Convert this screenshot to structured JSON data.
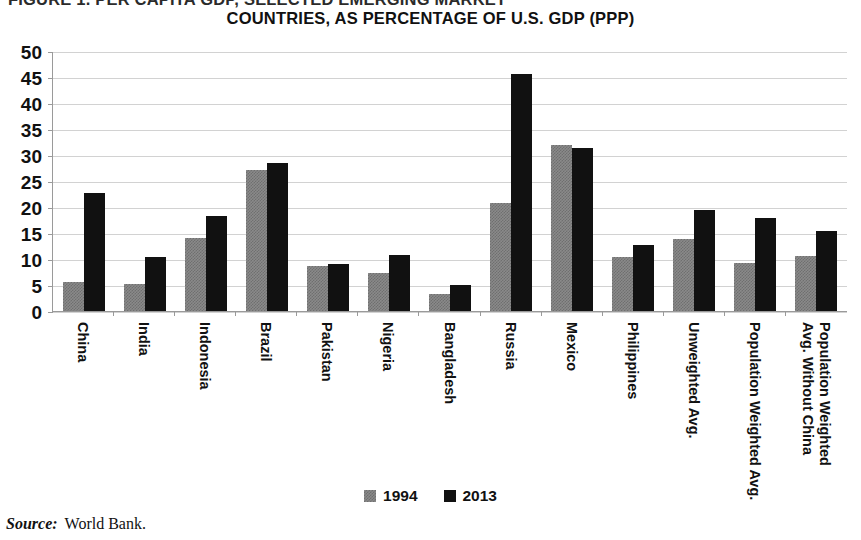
{
  "title": {
    "line1": "FIGURE 1. PER CAPITA GDP, SELECTED EMERGING MARKET",
    "line2": "COUNTRIES, AS PERCENTAGE OF U.S. GDP (PPP)"
  },
  "legend": {
    "position": "bottom-center",
    "entries": [
      {
        "label": "1994",
        "color": "#8a8a8a"
      },
      {
        "label": "2013",
        "color": "#111111"
      }
    ]
  },
  "source": {
    "key": "Source:",
    "value": "World Bank."
  },
  "axis": {
    "y_ticks": [
      "50",
      "45",
      "40",
      "35",
      "30",
      "25",
      "20",
      "15",
      "10",
      "5",
      "0"
    ]
  },
  "chart_data": {
    "type": "bar",
    "title": "FIGURE 1. PER CAPITA GDP, SELECTED EMERGING MARKET COUNTRIES, AS PERCENTAGE OF U.S. GDP (PPP)",
    "xlabel": "",
    "ylabel": "",
    "ylim": [
      0,
      50
    ],
    "ytick_step": 5,
    "grid": true,
    "legend_position": "bottom-center",
    "categories": [
      "China",
      "India",
      "Indonesia",
      "Brazil",
      "Pakistan",
      "Nigeria",
      "Bangladesh",
      "Russia",
      "Mexico",
      "Philippines",
      "Unweighted Avg.",
      "Population Weighted Avg.",
      "Population Weighted Avg. Without China"
    ],
    "series": [
      {
        "name": "1994",
        "color": "#8a8a8a",
        "values": [
          5.6,
          5.2,
          14.0,
          27.2,
          8.6,
          7.4,
          3.3,
          20.8,
          32.0,
          10.4,
          13.8,
          9.2,
          10.6
        ]
      },
      {
        "name": "2013",
        "color": "#111111",
        "values": [
          22.6,
          10.3,
          18.2,
          28.5,
          9.1,
          10.7,
          5.0,
          45.5,
          31.3,
          12.6,
          19.5,
          17.9,
          15.3
        ]
      }
    ]
  }
}
